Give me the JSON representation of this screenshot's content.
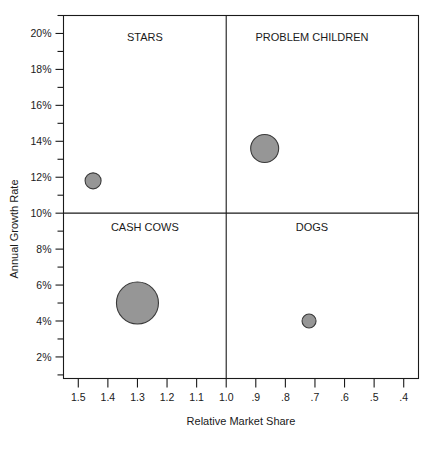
{
  "chart_data": {
    "type": "scatter",
    "title": "",
    "xlabel": "Relative Market Share",
    "ylabel": "Annual Growth Rate",
    "xlim": [
      1.55,
      0.35
    ],
    "ylim": [
      0.8,
      21.0
    ],
    "x_reversed": true,
    "grid": false,
    "legend": "none",
    "bubble_fill": "#969696",
    "bubble_stroke": "#3a3a3a",
    "x_tick_labels": [
      "1.5",
      "1.4",
      "1.3",
      "1.2",
      "1.1",
      "1.0",
      ".9",
      ".8",
      ".7",
      ".6",
      ".5",
      ".4"
    ],
    "x_tick_values": [
      1.5,
      1.4,
      1.3,
      1.2,
      1.1,
      1.0,
      0.9,
      0.8,
      0.7,
      0.6,
      0.5,
      0.4
    ],
    "y_tick_labels": [
      "20%",
      "18%",
      "16%",
      "14%",
      "12%",
      "10%",
      "8%",
      "6%",
      "4%",
      "2%"
    ],
    "y_tick_values": [
      20,
      18,
      16,
      14,
      12,
      10,
      8,
      6,
      4,
      2
    ],
    "y_minor_tick_values": [
      21,
      19,
      17,
      15,
      13,
      11,
      9,
      7,
      5,
      3,
      1
    ],
    "divider_x": 1.0,
    "divider_y": 10,
    "quadrants": [
      {
        "name": "stars",
        "label": "STARS",
        "x": 1.275,
        "y": 19.6
      },
      {
        "name": "problem-children",
        "label": "PROBLEM CHILDREN",
        "x": 0.71,
        "y": 19.6
      },
      {
        "name": "cash-cows",
        "label": "CASH COWS",
        "x": 1.275,
        "y": 9.0
      },
      {
        "name": "dogs",
        "label": "DOGS",
        "x": 0.71,
        "y": 9.0
      }
    ],
    "points": [
      {
        "name": "stars-bubble",
        "quadrant": "STARS",
        "x": 1.45,
        "y": 11.8,
        "r": 8
      },
      {
        "name": "problem-children-bubble",
        "quadrant": "PROBLEM CHILDREN",
        "x": 0.87,
        "y": 13.6,
        "r": 14
      },
      {
        "name": "cash-cows-bubble",
        "quadrant": "CASH COWS",
        "x": 1.3,
        "y": 5.0,
        "r": 21
      },
      {
        "name": "dogs-bubble",
        "quadrant": "DOGS",
        "x": 0.72,
        "y": 4.0,
        "r": 7
      }
    ]
  }
}
